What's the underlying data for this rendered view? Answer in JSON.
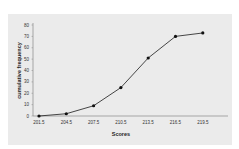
{
  "chart_data": {
    "type": "line",
    "title": "",
    "xlabel": "Scores",
    "ylabel": "cumulative frequency",
    "categories": [
      "201.5",
      "204.5",
      "207.5",
      "210.5",
      "213.5",
      "216.5",
      "219.5"
    ],
    "series": [
      {
        "name": "cumulative frequency",
        "values": [
          0,
          2,
          9,
          25,
          51,
          70,
          73
        ]
      }
    ],
    "yticks": [
      0,
      10,
      20,
      30,
      40,
      50,
      60,
      70,
      80
    ],
    "ylim": [
      0,
      80
    ],
    "grid": false,
    "legend": null,
    "colors": {
      "line": "#1a1a1a",
      "marker": "#111111",
      "panel": "#ebebeb",
      "axis": "#888888"
    }
  }
}
